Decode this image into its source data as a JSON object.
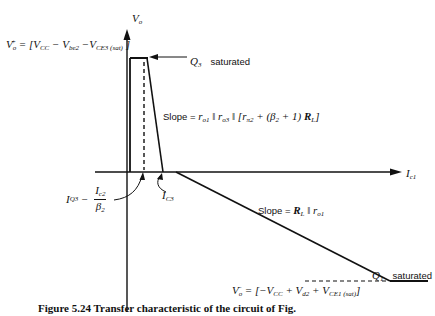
{
  "diagram": {
    "type": "transfer-characteristic",
    "axes": {
      "y_axis_label": "V",
      "y_axis_label_sub": "o",
      "x_axis_label": "I",
      "x_axis_label_sub": "c1"
    },
    "labels": {
      "vo_plus": "V°+ = [V_CC − V_be2 − V_CE3(sat)]",
      "vo_plus_parts": {
        "lhs": "V",
        "lhs_sub": "o",
        "lhs_sup": "+",
        "eq": " = [V",
        "t1_sub": "CC",
        "t2": " − V",
        "t2_sub": "be2",
        "t3": " −V",
        "t3_sub": "CE3 (sat)",
        "close": " ]"
      },
      "q3_saturated": {
        "device": "Q",
        "device_sub": "3",
        "state": "saturated"
      },
      "slope_upper": {
        "prefix": "Slope = ",
        "text": "r_o1 || r_o3 || [r_π2 + (β2 + 1) R_L]",
        "parts": {
          "r1": "r",
          "r1_sub": "o1",
          "par1": " ‖ ",
          "r2": "r",
          "r2_sub": "o3",
          "par2": " ‖ [",
          "r3": "r",
          "r3_sub": "π2",
          "plus": " + (",
          "beta": "β",
          "beta_sub": "2",
          "plus1": " + 1) ",
          "rl": "R",
          "rl_sub": "L",
          "close": "]"
        }
      },
      "iq3": {
        "lhs": "I",
        "lhs_sub": "Q3",
        "minus": " − ",
        "num": "I",
        "num_sub": "c2",
        "den": "β",
        "den_sub": "2"
      },
      "ic3": {
        "text": "I",
        "sub": "C3"
      },
      "slope_lower": {
        "prefix": "Slope = ",
        "rl": "R",
        "rl_sub": "L",
        "par": " ‖ ",
        "ro": "r",
        "ro_sub": "o1"
      },
      "q1_saturated": {
        "device": "Q",
        "device_sub": "1",
        "state": "saturated"
      },
      "vo_minus": "V°− = [−V_CC + V_d2 + V_CE1(sat)]",
      "vo_minus_parts": {
        "lhs": "V",
        "lhs_sub": "o",
        "lhs_sup": "−",
        "eq": " = [−V",
        "t1_sub": "CC",
        "t2": " + V",
        "t2_sub": "d2",
        "t3": " + V",
        "t3_sub": "CE1 (sat)",
        "close": "]"
      }
    },
    "caption": "Figure 5.24  Transfer characteristic of the circuit of Fig."
  }
}
